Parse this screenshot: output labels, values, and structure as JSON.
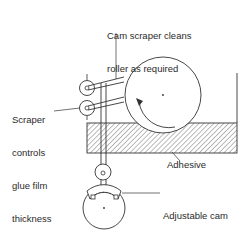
{
  "diagram": {
    "labels": {
      "cam_scraper": [
        "Cam scraper cleans",
        "roller as required"
      ],
      "scraper_controls": [
        "Scraper",
        "controls",
        "glue film",
        "thickness"
      ],
      "adhesive": "Adhesive",
      "adjustable_cam": [
        "Adjustable cam",
        "control"
      ]
    },
    "colors": {
      "line": "#333333",
      "hatch": "#555555",
      "background": "#ffffff"
    }
  }
}
